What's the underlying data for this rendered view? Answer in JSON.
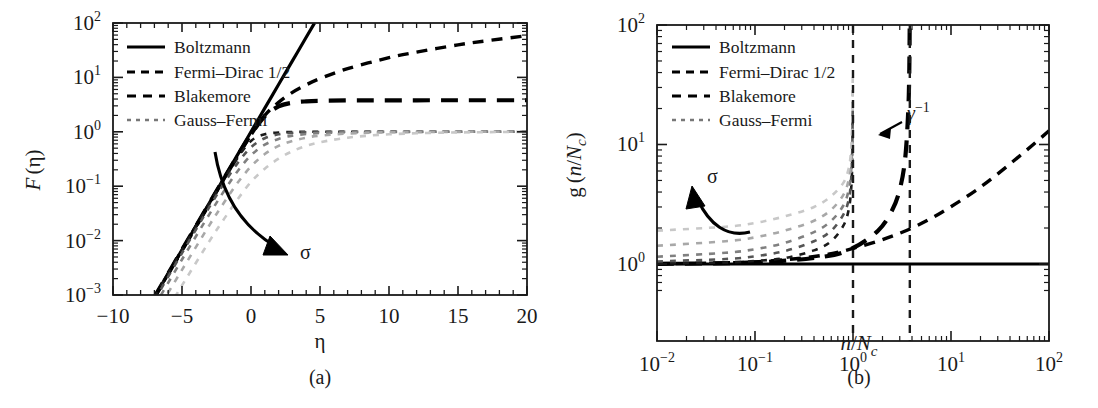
{
  "figure": {
    "background": "#ffffff",
    "foreground": "#1a1a1a",
    "panels": [
      "a",
      "b"
    ]
  },
  "panel_a": {
    "caption": "(a)",
    "legend_items": [
      {
        "label": "Boltzmann",
        "style": "solid"
      },
      {
        "label": "Fermi–Dirac 1/2",
        "style": "dashed"
      },
      {
        "label": "Blakemore",
        "style": "dashed-long"
      },
      {
        "label": "Gauss–Fermi",
        "style": "dotted"
      }
    ],
    "annotation": {
      "text": "σ",
      "kind": "curved-arrow",
      "direction": "down-right"
    },
    "xlabel": "η",
    "ylabel_parts": {
      "fn": "F",
      "arg": "(η)"
    },
    "xticks": [
      "−10",
      "−5",
      "0",
      "5",
      "10",
      "15",
      "20"
    ],
    "ytick_exponents": [
      "2",
      "1",
      "0",
      "−1",
      "−2",
      "−3"
    ],
    "ytick_mantissa": "10"
  },
  "panel_b": {
    "caption": "(b)",
    "legend_items": [
      {
        "label": "Boltzmann",
        "style": "solid"
      },
      {
        "label": "Fermi–Dirac 1/2",
        "style": "dashed"
      },
      {
        "label": "Blakemore",
        "style": "dashed-long"
      },
      {
        "label": "Gauss–Fermi",
        "style": "dotted"
      }
    ],
    "annotation_sigma": {
      "text": "σ",
      "kind": "curved-arrow",
      "direction": "up-left"
    },
    "annotation_gamma": {
      "text": "γ",
      "sup": "−1",
      "kind": "straight-arrow",
      "direction": "left"
    },
    "xlabel_parts": {
      "n": "n",
      "slash": "/",
      "N": "N",
      "sub": "c"
    },
    "ylabel_parts": {
      "g": "g",
      "open": "(",
      "n": "n",
      "slash": "/",
      "N": "N",
      "sub": "c",
      "close": ")"
    },
    "xtick_exponents": [
      "−2",
      "−1",
      "0",
      "1",
      "2"
    ],
    "xtick_mantissa": "10",
    "ytick_exponents": [
      "2",
      "1",
      "0"
    ],
    "ytick_mantissa": "10"
  },
  "chart_data": [
    {
      "type": "line",
      "panel": "a",
      "title": "",
      "xlabel": "η",
      "ylabel": "F (η)",
      "xscale": "linear",
      "yscale": "log",
      "xlim": [
        -10,
        20
      ],
      "ylim": [
        0.001,
        100
      ],
      "grid": false,
      "legend_position": "upper-left",
      "xticks": [
        -10,
        -5,
        0,
        5,
        10,
        15,
        20
      ],
      "yticks": [
        0.001,
        0.01,
        0.1,
        1,
        10,
        100
      ],
      "series": [
        {
          "name": "Boltzmann",
          "style": "solid",
          "color": "#000000",
          "comment": "exp(eta), straight line on semilog axes",
          "x": [
            -7,
            -6,
            -5,
            -4,
            -3,
            -2,
            -1,
            0,
            1,
            2,
            3,
            4,
            4.6
          ],
          "y": [
            0.000912,
            0.00248,
            0.00674,
            0.0183,
            0.0498,
            0.135,
            0.368,
            1.0,
            2.718,
            7.389,
            20.09,
            54.6,
            99.5
          ]
        },
        {
          "name": "Fermi–Dirac 1/2",
          "style": "dashed",
          "color": "#000000",
          "comment": "Fermi-Dirac integral order 1/2, sublinear growth at large eta",
          "x": [
            -7,
            -5,
            -3,
            -2,
            -1,
            0,
            1,
            2,
            3,
            4,
            5,
            7,
            10,
            12,
            15,
            17,
            20
          ],
          "y": [
            0.00091,
            0.0067,
            0.0489,
            0.131,
            0.346,
            0.879,
            2.0,
            3.48,
            5.3,
            7.3,
            9.5,
            14.5,
            23.0,
            29.2,
            39.6,
            46.8,
            58.6
          ]
        },
        {
          "name": "Blakemore",
          "style": "dashed-long",
          "color": "#000000",
          "comment": "Blakemore approximation saturating at 1/gamma = 3.8",
          "x": [
            -7,
            -5,
            -3,
            -2,
            -1,
            0,
            1,
            2,
            3,
            4,
            5,
            7,
            10,
            14,
            17,
            20
          ],
          "y": [
            0.00091,
            0.00673,
            0.0493,
            0.133,
            0.354,
            0.894,
            1.93,
            2.92,
            3.42,
            3.63,
            3.72,
            3.78,
            3.79,
            3.8,
            3.8,
            3.8
          ]
        },
        {
          "name": "Gauss–Fermi sigma1",
          "style": "dotted",
          "color": "#1a1a1a",
          "sigma_rank": 1,
          "x": [
            -7,
            -5,
            -3,
            -2,
            -1,
            0,
            1,
            2,
            3,
            4,
            5,
            7,
            10,
            14,
            17,
            20
          ],
          "y": [
            0.00091,
            0.0067,
            0.0486,
            0.128,
            0.323,
            0.68,
            0.9,
            0.97,
            0.99,
            1.0,
            1.0,
            1.0,
            1.0,
            1.0,
            1.0,
            1.0
          ]
        },
        {
          "name": "Gauss–Fermi sigma2",
          "style": "dotted",
          "color": "#555555",
          "sigma_rank": 2,
          "x": [
            -7,
            -5,
            -3,
            -2,
            -1,
            0,
            1,
            2,
            3,
            4,
            5,
            7,
            10,
            14,
            17,
            20
          ],
          "y": [
            0.0008,
            0.0059,
            0.042,
            0.108,
            0.26,
            0.52,
            0.76,
            0.9,
            0.96,
            0.98,
            0.99,
            1.0,
            1.0,
            1.0,
            1.0,
            1.0
          ]
        },
        {
          "name": "Gauss–Fermi sigma3",
          "style": "dotted",
          "color": "#808080",
          "sigma_rank": 3,
          "x": [
            -7,
            -5,
            -3,
            -2,
            -1,
            0,
            1,
            2,
            3,
            4,
            5,
            7,
            10,
            14,
            17,
            20
          ],
          "y": [
            0.00062,
            0.0045,
            0.031,
            0.078,
            0.185,
            0.37,
            0.58,
            0.74,
            0.85,
            0.91,
            0.95,
            0.98,
            0.995,
            1.0,
            1.0,
            1.0
          ]
        },
        {
          "name": "Gauss–Fermi sigma4",
          "style": "dotted",
          "color": "#a8a8a8",
          "sigma_rank": 4,
          "x": [
            -7,
            -5,
            -3,
            -2,
            -1,
            0,
            1,
            2,
            3,
            4,
            5,
            7,
            10,
            14,
            17,
            20
          ],
          "y": [
            0.00042,
            0.0029,
            0.0195,
            0.048,
            0.113,
            0.23,
            0.39,
            0.55,
            0.68,
            0.78,
            0.85,
            0.93,
            0.98,
            0.995,
            1.0,
            1.0
          ]
        },
        {
          "name": "Gauss–Fermi sigma5",
          "style": "dotted",
          "color": "#c8c8c8",
          "sigma_rank": 5,
          "x": [
            -7,
            -5,
            -3,
            -2,
            -1,
            0,
            1,
            2,
            3,
            4,
            5,
            7,
            10,
            14,
            17,
            20
          ],
          "y": [
            0.00022,
            0.0015,
            0.0099,
            0.024,
            0.056,
            0.12,
            0.21,
            0.32,
            0.44,
            0.55,
            0.64,
            0.78,
            0.9,
            0.965,
            0.985,
            1.0
          ]
        }
      ]
    },
    {
      "type": "line",
      "panel": "b",
      "title": "",
      "xlabel": "n/N_c",
      "ylabel": "g (n/N_c)",
      "xscale": "log",
      "yscale": "log",
      "xlim": [
        0.01,
        100
      ],
      "ylim": [
        0.55,
        100
      ],
      "grid": false,
      "legend_position": "upper-left",
      "xticks": [
        0.01,
        0.1,
        1,
        10,
        100
      ],
      "yticks": [
        1,
        10,
        100
      ],
      "vlines": [
        {
          "x": 1.0,
          "style": "dashed",
          "label": ""
        },
        {
          "x": 3.8,
          "style": "dashed",
          "label": "γ⁻¹"
        }
      ],
      "series": [
        {
          "name": "Boltzmann",
          "style": "solid",
          "color": "#000000",
          "comment": "degeneracy factor identically 1",
          "x": [
            0.01,
            100
          ],
          "y": [
            1.0,
            1.0
          ]
        },
        {
          "name": "Fermi–Dirac 1/2",
          "style": "dashed",
          "color": "#000000",
          "x": [
            0.01,
            0.05,
            0.1,
            0.3,
            0.6,
            1.0,
            2.0,
            4.0,
            8.0,
            20.0,
            50.0,
            100.0
          ],
          "y": [
            1.005,
            1.02,
            1.04,
            1.12,
            1.22,
            1.35,
            1.6,
            2.0,
            2.7,
            4.4,
            8.0,
            13.0
          ]
        },
        {
          "name": "Blakemore",
          "style": "dashed-long",
          "color": "#000000",
          "comment": "diverges at n/Nc = gamma^-1 = 3.8",
          "x": [
            0.01,
            0.1,
            0.5,
            1.0,
            1.8,
            2.5,
            3.0,
            3.4,
            3.65,
            3.75,
            3.79
          ],
          "y": [
            1.003,
            1.03,
            1.15,
            1.36,
            1.9,
            2.8,
            4.2,
            7.5,
            18.0,
            40.0,
            100.0
          ]
        },
        {
          "name": "Gauss–Fermi sigma1",
          "style": "dotted",
          "color": "#1a1a1a",
          "sigma_rank": 1,
          "x": [
            0.01,
            0.05,
            0.1,
            0.2,
            0.4,
            0.6,
            0.8,
            0.9,
            0.95,
            0.98,
            0.995
          ],
          "y": [
            1.01,
            1.03,
            1.06,
            1.12,
            1.3,
            1.55,
            2.1,
            2.8,
            3.9,
            6.5,
            18.0
          ]
        },
        {
          "name": "Gauss–Fermi sigma2",
          "style": "dotted",
          "color": "#555555",
          "sigma_rank": 2,
          "x": [
            0.01,
            0.05,
            0.1,
            0.2,
            0.4,
            0.6,
            0.8,
            0.9,
            0.95,
            0.98,
            0.995
          ],
          "y": [
            1.05,
            1.1,
            1.16,
            1.28,
            1.55,
            1.9,
            2.6,
            3.4,
            4.7,
            8.0,
            22.0
          ]
        },
        {
          "name": "Gauss–Fermi sigma3",
          "style": "dotted",
          "color": "#808080",
          "sigma_rank": 3,
          "x": [
            0.01,
            0.05,
            0.1,
            0.2,
            0.4,
            0.6,
            0.8,
            0.9,
            0.95,
            0.98,
            0.995
          ],
          "y": [
            1.15,
            1.24,
            1.33,
            1.5,
            1.85,
            2.3,
            3.1,
            4.1,
            5.6,
            9.5,
            26.0
          ]
        },
        {
          "name": "Gauss–Fermi sigma4",
          "style": "dotted",
          "color": "#a8a8a8",
          "sigma_rank": 4,
          "x": [
            0.01,
            0.05,
            0.1,
            0.2,
            0.4,
            0.6,
            0.8,
            0.9,
            0.95,
            0.98,
            0.995
          ],
          "y": [
            1.42,
            1.55,
            1.67,
            1.9,
            2.3,
            2.85,
            3.8,
            5.0,
            6.8,
            11.5,
            32.0
          ]
        },
        {
          "name": "Gauss–Fermi sigma5",
          "style": "dotted",
          "color": "#c8c8c8",
          "sigma_rank": 5,
          "x": [
            0.01,
            0.05,
            0.1,
            0.2,
            0.4,
            0.6,
            0.8,
            0.9,
            0.95,
            0.98,
            0.995
          ],
          "y": [
            1.9,
            2.05,
            2.2,
            2.5,
            3.0,
            3.7,
            4.8,
            6.2,
            8.4,
            14.0,
            38.0
          ]
        }
      ]
    }
  ]
}
